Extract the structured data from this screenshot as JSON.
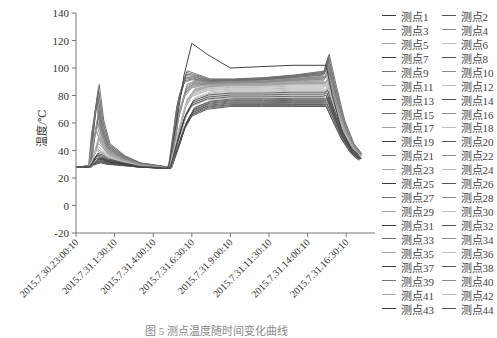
{
  "chart_data": {
    "type": "line",
    "title": "",
    "xlabel": "",
    "ylabel": "温度/℃",
    "ylim": [
      -20,
      140
    ],
    "yticks": [
      -20,
      0,
      20,
      40,
      60,
      80,
      100,
      120,
      140
    ],
    "xtick_labels": [
      "2015.7.30.23:00:10",
      "2015.7.31.1:30:10",
      "2015.7.31.4:00:10",
      "2015.7.31.6:30:10",
      "2015.7.31.9:00:10",
      "2015.7.31.11:30:10",
      "2015.7.31.14:00:10",
      "2015.7.31.16:30:10"
    ],
    "grid": false,
    "legend_position": "right",
    "legend": [
      "测点1",
      "测点2",
      "测点3",
      "测点4",
      "测点5",
      "测点6",
      "测点7",
      "测点8",
      "测点9",
      "测点10",
      "测点11",
      "测点12",
      "测点13",
      "测点14",
      "测点15",
      "测点16",
      "测点17",
      "测点18",
      "测点19",
      "测点20",
      "测点21",
      "测点22",
      "测点23",
      "测点24",
      "测点25",
      "测点26",
      "测点27",
      "测点28",
      "测点29",
      "测点30",
      "测点31",
      "测点32",
      "测点33",
      "测点34",
      "测点35",
      "测点36",
      "测点37",
      "测点38",
      "测点39",
      "测点40",
      "测点41",
      "测点42",
      "测点43",
      "测点44"
    ],
    "x_hours": [
      0,
      0.8,
      1.0,
      1.3,
      1.6,
      2.0,
      3.0,
      4.0,
      5.8,
      6.0,
      6.5,
      7.0,
      7.5,
      8.5,
      10.0,
      12.0,
      14.0,
      16.0,
      16.2,
      16.6,
      17.2,
      17.8,
      18.3
    ],
    "series_summary": [
      {
        "name": "测点1",
        "values": [
          28,
          28,
          30,
          34,
          34,
          32,
          30,
          28,
          27,
          28,
          60,
          95,
          118,
          110,
          100,
          101,
          102,
          102,
          102,
          80,
          55,
          42,
          37
        ]
      },
      {
        "name": "upper-envelope",
        "values": [
          28,
          29,
          60,
          88,
          62,
          45,
          36,
          31,
          28,
          30,
          80,
          98,
          96,
          92,
          92,
          93,
          95,
          98,
          110,
          90,
          62,
          45,
          38
        ]
      },
      {
        "name": "median-band",
        "values": [
          28,
          28,
          33,
          42,
          40,
          36,
          32,
          29,
          27,
          28,
          50,
          72,
          82,
          86,
          87,
          87,
          88,
          88,
          90,
          75,
          55,
          42,
          36
        ]
      },
      {
        "name": "lower-envelope",
        "values": [
          28,
          28,
          29,
          30,
          31,
          30,
          29,
          28,
          27,
          27,
          40,
          55,
          65,
          70,
          72,
          72,
          72,
          72,
          72,
          62,
          48,
          38,
          33
        ]
      }
    ],
    "colors": {
      "lines": "#5a5a5a",
      "axis": "#777777"
    }
  },
  "caption": "图 5  测点温度随时间变化曲线"
}
